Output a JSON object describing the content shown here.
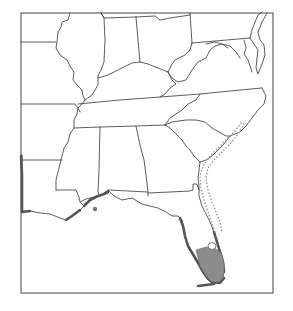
{
  "map": {
    "subject": "Southeastern United States range map",
    "region": "Eastern / Southeastern USA (Gulf Coast and Atlantic coast)",
    "legend": [],
    "title": "",
    "features": {
      "state_borders": "thin dark gray outline",
      "range_primary": {
        "description": "dark gray coastal band along Gulf Coast (Louisiana to Florida panhandle) and Florida Atlantic/Gulf coasts",
        "color": "#555555"
      },
      "range_interior": {
        "description": "medium gray filled area in southern Florida (Everglades region) with a small white hole (Lake Okeechobee)",
        "color": "#8c8c8c"
      },
      "range_dotted": {
        "description": "dotted gray line outlining possible extension along Atlantic coast from northern Florida to North Carolina",
        "color": "#9a9a9a"
      },
      "isolated_record": {
        "description": "single gray dot offshore in Gulf south of Mississippi/Alabama",
        "color": "#777777"
      }
    },
    "colors": {
      "background": "#ffffff",
      "border": "#4a4a4a",
      "frame": "#555555"
    }
  }
}
